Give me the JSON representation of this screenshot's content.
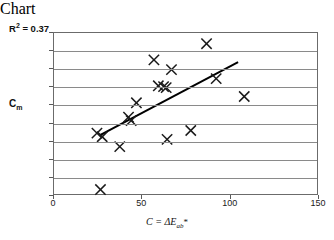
{
  "chart_data": {
    "type": "scatter",
    "title": "",
    "xlabel": "C = ΔEₐᵇ*",
    "ylabel": "Cₘ",
    "xlim": [
      0,
      150
    ],
    "ylim": [
      1,
      2.8
    ],
    "grid": true,
    "legend": false,
    "x_ticks": [
      0,
      50,
      100,
      150
    ],
    "y_ticks": [
      1,
      1.2,
      1.4,
      1.6,
      1.8,
      2,
      2.2,
      2.4,
      2.6,
      2.8
    ],
    "x_tick_labels": [
      "0",
      "50",
      "100",
      "150"
    ],
    "y_tick_labels": [
      "1",
      "1.2",
      "1.4",
      "1.6",
      "1.8",
      "2",
      "2.2",
      "2.4",
      "2.6",
      "2.8"
    ],
    "annotations": [
      {
        "text": "R2 = 0.37",
        "display": "R² = 0.37",
        "x": 8,
        "y": 2.74
      }
    ],
    "r_squared": 0.37,
    "points": [
      {
        "x": 24.5,
        "y": 1.68
      },
      {
        "x": 27.5,
        "y": 1.64
      },
      {
        "x": 26.5,
        "y": 1.05
      },
      {
        "x": 37.5,
        "y": 1.53
      },
      {
        "x": 42.5,
        "y": 1.86
      },
      {
        "x": 44.0,
        "y": 1.82
      },
      {
        "x": 47.0,
        "y": 2.02
      },
      {
        "x": 57.0,
        "y": 2.5
      },
      {
        "x": 59.5,
        "y": 2.21
      },
      {
        "x": 62.5,
        "y": 2.2
      },
      {
        "x": 64.0,
        "y": 2.19
      },
      {
        "x": 64.5,
        "y": 1.61
      },
      {
        "x": 67.0,
        "y": 2.39
      },
      {
        "x": 78.0,
        "y": 1.71
      },
      {
        "x": 87.0,
        "y": 2.68
      },
      {
        "x": 92.5,
        "y": 2.29
      },
      {
        "x": 108.5,
        "y": 2.09
      }
    ],
    "trendline": {
      "type": "linear",
      "x_start": 26.0,
      "y_start": 1.655,
      "x_end": 105.0,
      "y_end": 2.475
    }
  }
}
